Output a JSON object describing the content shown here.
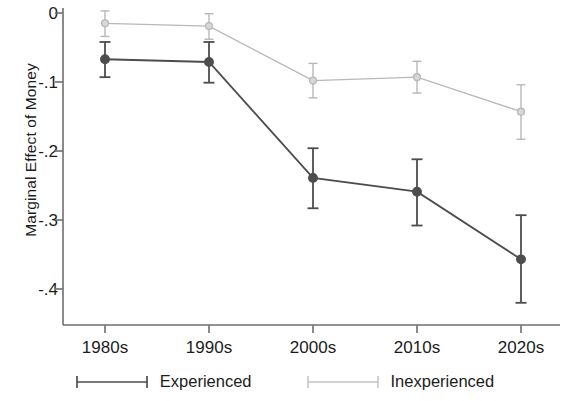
{
  "chart_data": {
    "type": "line",
    "title": "",
    "subtitle": "",
    "xlabel": "",
    "ylabel": "Marginal Effect of Money",
    "categories": [
      "1980s",
      "1990s",
      "2000s",
      "2010s",
      "2020s"
    ],
    "ylim": [
      -0.45,
      0.02
    ],
    "yticks": [
      0,
      -0.1,
      -0.2,
      -0.3,
      -0.4
    ],
    "ytick_labels": [
      "0",
      "-.1",
      "-.2",
      "-.3",
      "-.4"
    ],
    "grid": false,
    "legend_position": "bottom",
    "error_bars": "vertical capped",
    "series": [
      {
        "name": "Experienced",
        "color": "#4d4d4d",
        "marker": "filled-circle",
        "linestyle": "solid",
        "values": [
          -0.067,
          -0.071,
          -0.239,
          -0.259,
          -0.357
        ],
        "ci_low": [
          -0.093,
          -0.101,
          -0.283,
          -0.308,
          -0.42
        ],
        "ci_high": [
          -0.042,
          -0.042,
          -0.196,
          -0.212,
          -0.293
        ]
      },
      {
        "name": "Inexperienced",
        "color": "#b8b8b8",
        "marker": "open-circle",
        "linestyle": "solid-light",
        "values": [
          -0.015,
          -0.019,
          -0.098,
          -0.093,
          -0.143
        ],
        "ci_low": [
          -0.034,
          -0.038,
          -0.123,
          -0.116,
          -0.183
        ],
        "ci_high": [
          0.003,
          -0.001,
          -0.073,
          -0.07,
          -0.104
        ]
      }
    ]
  },
  "axis": {
    "y_title": "Marginal Effect of Money",
    "y_tick_labels": [
      "0",
      "-.1",
      "-.2",
      "-.3",
      "-.4"
    ],
    "x_tick_labels": [
      "1980s",
      "1990s",
      "2000s",
      "2010s",
      "2020s"
    ]
  },
  "legend": {
    "items": [
      {
        "label": "Experienced",
        "color": "#4d4d4d"
      },
      {
        "label": "Inexperienced",
        "color": "#bdbdbd"
      }
    ]
  }
}
